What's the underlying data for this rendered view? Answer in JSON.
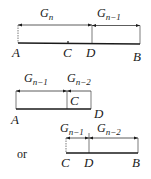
{
  "figure": {
    "diagram1": {
      "top_labels": [
        {
          "base": "G",
          "sub": "n"
        },
        {
          "base": "G",
          "sub": "n−1"
        }
      ],
      "points": [
        "A",
        "C",
        "D",
        "B"
      ]
    },
    "diagram2": {
      "top_labels": [
        {
          "base": "G",
          "sub": "n−1"
        },
        {
          "base": "G",
          "sub": "n−2"
        }
      ],
      "points": [
        "A",
        "C",
        "D"
      ]
    },
    "connector": "or",
    "diagram3": {
      "top_labels": [
        {
          "base": "G",
          "sub": "n−1"
        },
        {
          "base": "G",
          "sub": "n−2"
        }
      ],
      "points": [
        "C",
        "D",
        "B"
      ]
    },
    "colors": {
      "ink": "#1a1a1a",
      "background": "#ffffff"
    }
  }
}
